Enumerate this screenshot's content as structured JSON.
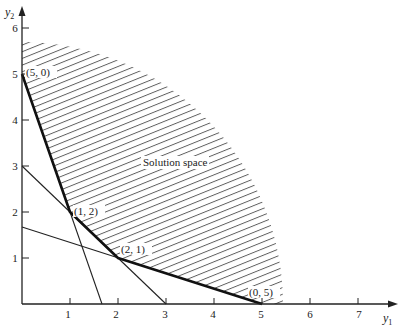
{
  "diagram": {
    "type": "linear-programming-feasible-region",
    "region_label": "Solution space",
    "axes": {
      "x": {
        "label": "y",
        "subscript": "1",
        "ticks": [
          "1",
          "2",
          "3",
          "4",
          "5",
          "6",
          "7"
        ]
      },
      "y": {
        "label": "y",
        "subscript": "2",
        "ticks": [
          "1",
          "2",
          "3",
          "4",
          "5",
          "6"
        ]
      }
    },
    "constraint_lines": [
      {
        "name": "3y1 + y2 = 5",
        "from": [
          0,
          5
        ],
        "to": [
          1.667,
          0
        ]
      },
      {
        "name": "y1 + y2 = 3",
        "from": [
          0,
          3
        ],
        "to": [
          3,
          0
        ]
      },
      {
        "name": "y1 + 3y2 = 5",
        "from": [
          0,
          1.667
        ],
        "to": [
          5,
          0
        ]
      }
    ],
    "corner_points": [
      {
        "label": "(5, 0)",
        "at": [
          0,
          5
        ]
      },
      {
        "label": "(1, 2)",
        "at": [
          1,
          2
        ]
      },
      {
        "label": "(2, 1)",
        "at": [
          2,
          1
        ]
      },
      {
        "label": "(0, 5)",
        "at": [
          5,
          0
        ]
      }
    ]
  }
}
